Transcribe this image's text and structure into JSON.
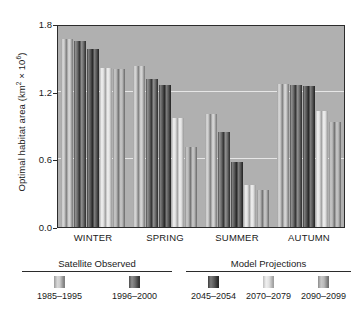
{
  "chart_data": {
    "type": "bar",
    "title": "",
    "xlabel": "",
    "ylabel": "Optimal habitat area (km2 x 10^6)",
    "ylabel_main": "Optimal habitat area (km",
    "ylabel_sup1": "2",
    "ylabel_mid": " × 10",
    "ylabel_sup2": "6",
    "ylabel_end": ")",
    "ylim": [
      0.0,
      1.8
    ],
    "yticks": [
      "0.0",
      "0.6",
      "1.2",
      "1.8"
    ],
    "ytick_values": [
      0.0,
      0.6,
      1.2,
      1.8
    ],
    "grid": "horizontal gridlines at 0.6 and 1.2",
    "legend_position": "below plot",
    "plot_background": "#b0b0b0",
    "categories": [
      "WINTER",
      "SPRING",
      "SUMMER",
      "AUTUMN"
    ],
    "series": [
      {
        "name": "1985–1995",
        "group": "Satellite Observed",
        "swatch": "sw-a",
        "values": [
          1.67,
          1.43,
          1.0,
          1.27
        ]
      },
      {
        "name": "1996–2000",
        "group": "Satellite Observed",
        "swatch": "sw-b",
        "values": [
          1.65,
          1.31,
          0.84,
          1.26
        ]
      },
      {
        "name": "2045–2054",
        "group": "Model Projections",
        "swatch": "sw-c",
        "values": [
          1.58,
          1.26,
          0.58,
          1.25
        ]
      },
      {
        "name": "2070–2079",
        "group": "Model Projections",
        "swatch": "sw-d",
        "values": [
          1.41,
          0.97,
          0.37,
          1.03
        ]
      },
      {
        "name": "2090–2099",
        "group": "Model Projections",
        "swatch": "sw-e",
        "values": [
          1.4,
          0.71,
          0.33,
          0.93
        ]
      }
    ],
    "extra_bars_note": "each series drawn as a closely spaced pair of shaded bars"
  },
  "legend": {
    "satellite": {
      "title": "Satellite Observed",
      "items": [
        {
          "label": "1985–1995",
          "swatch": "sw-a"
        },
        {
          "label": "1996–2000",
          "swatch": "sw-b"
        }
      ]
    },
    "model": {
      "title": "Model Projections",
      "items": [
        {
          "label": "2045–2054",
          "swatch": "sw-c"
        },
        {
          "label": "2070–2079",
          "swatch": "sw-d"
        },
        {
          "label": "2090–2099",
          "swatch": "sw-e"
        }
      ]
    }
  }
}
